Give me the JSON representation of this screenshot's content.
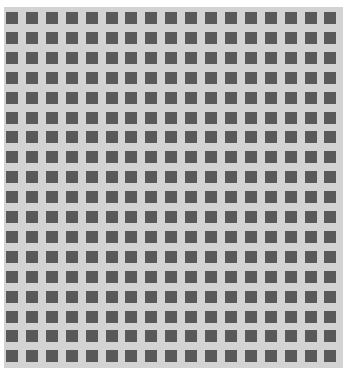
{
  "pattern": {
    "columns": 17,
    "rows": 18,
    "square_size": 12,
    "pitch_x": 19.9,
    "pitch_y": 19.9,
    "offset_x": 2,
    "offset_y": 5,
    "colors": {
      "page_background": "#ffffff",
      "grid_background": "#d3d3d3",
      "square": "#595959"
    }
  }
}
